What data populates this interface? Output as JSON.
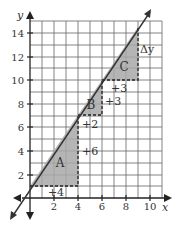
{
  "diagram": {
    "axes": {
      "x_label": "x",
      "y_label": "y",
      "x_ticks": [
        "2",
        "4",
        "6",
        "8",
        "10"
      ],
      "y_ticks": [
        "2",
        "4",
        "6",
        "8",
        "10",
        "12",
        "14"
      ],
      "x_range": [
        0,
        11
      ],
      "y_range": [
        0,
        15
      ]
    },
    "line": {
      "slope": 1.5,
      "intercept": 1
    },
    "triangles": [
      {
        "label": "A",
        "run_label": "+4",
        "rise_label": "+6"
      },
      {
        "label": "B",
        "run_label": "+2",
        "rise_label": "+3"
      },
      {
        "label": "C",
        "run_label": "+3",
        "rise_label": "Δy"
      }
    ],
    "colors": {
      "shade": "#a8a8a8",
      "grid": "#555555",
      "line": "#333333"
    }
  }
}
